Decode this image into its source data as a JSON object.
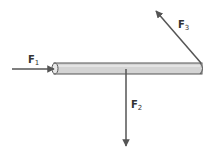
{
  "diagram": {
    "rod": {
      "fill": "#d4d4d4",
      "stroke": "#555555"
    },
    "arrow_color": "#555555",
    "forces": [
      {
        "id": "F1",
        "symbol": "F",
        "subscript": "1",
        "direction": "right",
        "applied_at": "left end"
      },
      {
        "id": "F2",
        "symbol": "F",
        "subscript": "2",
        "direction": "down",
        "applied_at": "middle"
      },
      {
        "id": "F3",
        "symbol": "F",
        "subscript": "3",
        "direction": "up-left",
        "applied_at": "right end"
      }
    ]
  }
}
